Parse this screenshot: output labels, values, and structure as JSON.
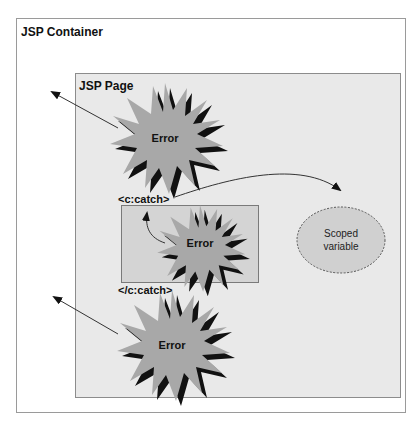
{
  "diagram": {
    "container": {
      "title": "JSP Container"
    },
    "page": {
      "title": "JSP Page"
    },
    "catch_block": {
      "open_tag": "<c:catch>",
      "close_tag": "</c:catch>"
    },
    "errors": [
      {
        "label": "Error",
        "position": "top",
        "propagates_to": "JSP Container"
      },
      {
        "label": "Error",
        "position": "inside-catch",
        "propagates_to": "c:catch"
      },
      {
        "label": "Error",
        "position": "bottom",
        "propagates_to": "JSP Container"
      }
    ],
    "scoped_variable": {
      "label_line1": "Scoped",
      "label_line2": "variable"
    },
    "colors": {
      "page_fill": "#e9e9e9",
      "catch_fill": "#d4d4d4",
      "burst_fill": "#a8a8a8",
      "burst_shadow": "#111111",
      "cloud_fill": "#d0d0d0"
    }
  }
}
